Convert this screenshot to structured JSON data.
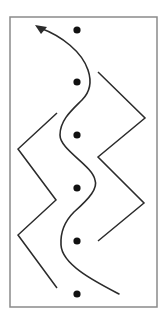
{
  "diagram": {
    "title": "",
    "canvas": {
      "width": 164,
      "height": 322,
      "background": "#ffffff"
    },
    "frame": {
      "x": 10,
      "y": 17,
      "width": 147,
      "height": 290,
      "stroke": "#8a8a8a",
      "stroke_width": 1.5
    },
    "colors": {
      "line": "#2b2b2b",
      "dot": "#111111"
    },
    "dots": [
      {
        "cx": 77,
        "cy": 30,
        "r": 3.6
      },
      {
        "cx": 77,
        "cy": 82,
        "r": 3.6
      },
      {
        "cx": 77,
        "cy": 135,
        "r": 3.6
      },
      {
        "cx": 77,
        "cy": 188,
        "r": 3.6
      },
      {
        "cx": 77,
        "cy": 241,
        "r": 3.6
      },
      {
        "cx": 77,
        "cy": 294,
        "r": 3.6
      }
    ],
    "curve": {
      "description": "S-shaped curve weaving through the dot column, ending in an arrow at top-left",
      "path": "M 119 294 C 96 282, 62 265, 61 245 C 60 228, 68 218, 74 212 C 90 198, 98 188, 95 180 C 92 165, 60 150, 60 135 C 60 120, 72 110, 82 100 C 90 92, 92 82, 88 70 C 82 52, 62 36, 40 28",
      "stroke_width": 1.6,
      "arrowhead": {
        "tip": [
          36,
          25
        ],
        "points": "35,25 47,27 41,34"
      }
    },
    "zigzag_right": {
      "points": "98,72 145,118 98,157 144,203 98,241",
      "stroke_width": 1.5
    },
    "zigzag_left": {
      "points": "57,113 18,149 56,200 18,235 57,288",
      "stroke_width": 1.5
    }
  }
}
